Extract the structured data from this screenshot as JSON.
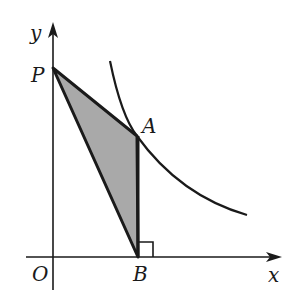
{
  "diagram": {
    "type": "coordinate-geometry",
    "axes": {
      "x_label": "x",
      "y_label": "y",
      "origin_label": "O"
    },
    "points": {
      "P": {
        "label": "P",
        "on": "y-axis"
      },
      "A": {
        "label": "A",
        "on": "curve"
      },
      "B": {
        "label": "B",
        "on": "x-axis",
        "note": "AB perpendicular to x-axis"
      }
    },
    "shaded_region": "triangle PAB",
    "right_angle_marker": "at B",
    "colors": {
      "stroke": "#1a1a1a",
      "fill": "#a9a9a9",
      "background": "#ffffff"
    }
  }
}
